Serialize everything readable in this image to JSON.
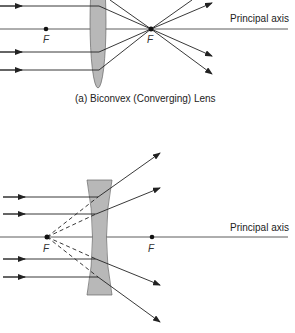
{
  "diagram_a": {
    "caption": "(a) Biconvex (Converging) Lens",
    "axis_label": "Principal axis",
    "focus_left": "F",
    "focus_right": "F"
  },
  "diagram_b": {
    "axis_label": "Principal axis",
    "focus_left": "F",
    "focus_right": "F"
  },
  "colors": {
    "lens_fill": "#b8b8b8",
    "line": "#222222"
  }
}
